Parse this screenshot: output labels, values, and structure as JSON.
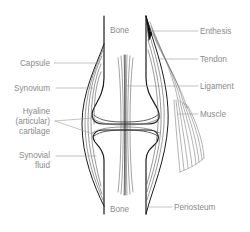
{
  "colors": {
    "outline": "#1a1a1a",
    "structure_lines": "#555555",
    "label_text": "#8a8a8a",
    "leader_lines": "#9a9a9a",
    "background": "#ffffff"
  },
  "labels": {
    "bone_top": "Bone",
    "bone_bottom": "Bone",
    "capsule": "Capsule",
    "synovium": "Synovium",
    "hyaline_line1": "Hyaline",
    "hyaline_line2": "(articular)",
    "hyaline_line3": "cartilage",
    "synovial_line1": "Synovial",
    "synovial_line2": "fluid",
    "enthesis": "Enthesis",
    "tendon": "Tendon",
    "ligament": "Ligament",
    "muscle": "Muscle",
    "periosteum": "Periosteum"
  }
}
